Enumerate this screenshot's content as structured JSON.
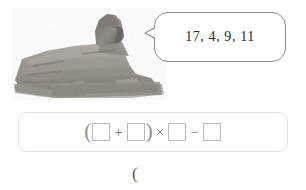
{
  "speech_bubble": {
    "text": "17, 4, 9, 11",
    "numbers": [
      17,
      4,
      9,
      11
    ],
    "border_color": "#8a8a8a"
  },
  "illustration": {
    "subject": "great-sphinx-of-giza",
    "alt": "Great Sphinx of Giza statue, grayscale photo"
  },
  "equation": {
    "open_paren": "(",
    "plus": "+",
    "close_paren": ")",
    "times": "×",
    "minus": "−",
    "blank": "",
    "boxes": [
      "",
      "",
      "",
      ""
    ],
    "box_border_color": "#b9b9b9",
    "panel_border_color": "#e2e2e2"
  },
  "answer_line": {
    "text": "("
  }
}
